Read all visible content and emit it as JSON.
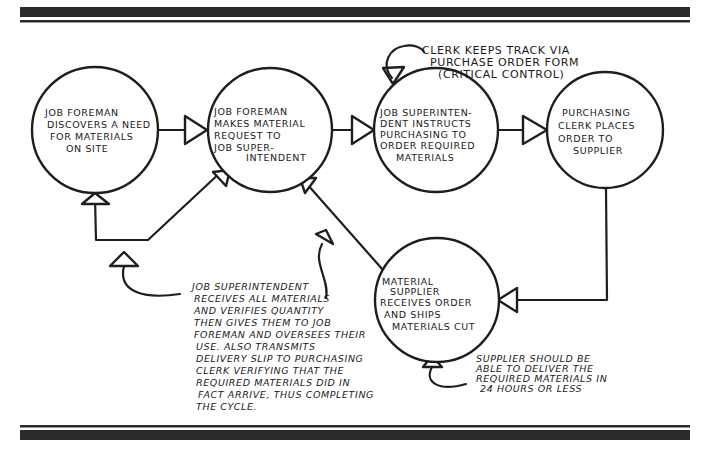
{
  "diagram": {
    "type": "process-cycle",
    "nodes": [
      {
        "id": "n1",
        "lines": [
          "Job Foreman",
          "Discovers a need",
          "for Materials",
          "on Site"
        ]
      },
      {
        "id": "n2",
        "lines": [
          "Job Foreman",
          "Makes Material",
          "Request to",
          "Job Super-",
          "intendent"
        ]
      },
      {
        "id": "n3",
        "lines": [
          "Job Superinten-",
          "dent instructs",
          "Purchasing to",
          "order Required",
          "Materials"
        ]
      },
      {
        "id": "n4",
        "lines": [
          "Purchasing",
          "Clerk Places",
          "Order to",
          "Supplier"
        ]
      },
      {
        "id": "n5",
        "lines": [
          "Material",
          "Supplier",
          "Receives Order",
          "and Ships",
          "Materials Cut"
        ]
      }
    ],
    "edges": [
      {
        "from": "n1",
        "to": "n2"
      },
      {
        "from": "n2",
        "to": "n3"
      },
      {
        "from": "n3",
        "to": "n4"
      },
      {
        "from": "n4",
        "to": "n5"
      },
      {
        "from": "n5",
        "to": "n2"
      },
      {
        "from": "n5",
        "to": "n1 / n2",
        "note": "branch back to Job Foreman"
      }
    ],
    "annotations": {
      "clerk_note": [
        "Clerk keeps track via",
        "Purchase order form",
        "(Critical Control)"
      ],
      "superintendent_note": [
        "Job Superintendent",
        "Receives all materials",
        "and verifies quantity",
        "then gives them to Job",
        "Foreman and oversees their",
        "use. Also transmits",
        "delivery slip to Purchasing",
        "Clerk verifying that the",
        "required materials did in",
        "fact arrive, thus completing",
        "the cycle."
      ],
      "supplier_note": [
        "Supplier should be",
        "able to deliver the",
        "required materials in",
        "24 hours or less"
      ]
    },
    "colors": {
      "ink": "#1e1e1e",
      "paper": "#ffffff",
      "rule": "#2a2a2a"
    }
  }
}
